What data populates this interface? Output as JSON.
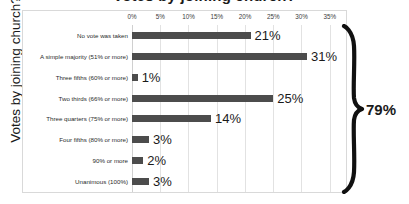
{
  "chart_data": {
    "type": "bar",
    "orientation": "horizontal",
    "title": "Votes by joining church?",
    "xlabel": "",
    "ylabel": "Votes by joining church?",
    "xlim": [
      0,
      37
    ],
    "xticks": [
      "0%",
      "5%",
      "10%",
      "15%",
      "20%",
      "25%",
      "30%",
      "35%"
    ],
    "xtick_values": [
      0,
      5,
      10,
      15,
      20,
      25,
      30,
      35
    ],
    "grid": true,
    "legend": false,
    "categories": [
      "No vote was taken",
      "A simple majority (51% or more)",
      "Three fifths (60% or more)",
      "Two thirds (66% or more)",
      "Three quarters (75% or more)",
      "Four fifths (80% or more)",
      "90% or more",
      "Unanimous (100%)"
    ],
    "values": [
      21,
      31,
      1,
      25,
      14,
      3,
      2,
      3
    ],
    "value_labels": [
      "21%",
      "31%",
      "1%",
      "25%",
      "14%",
      "3%",
      "2%",
      "3%"
    ],
    "bar_color": "#4c4c4c",
    "annotations": [
      {
        "name": "total-brace",
        "label": "79%",
        "spans_categories": [
          "A simple majority (51% or more)",
          "Three fifths (60% or more)",
          "Two thirds (66% or more)",
          "Three quarters (75% or more)",
          "Four fifths (80% or more)",
          "90% or more",
          "Unanimous (100%)"
        ]
      }
    ]
  },
  "callout": {
    "total_label": "79%"
  },
  "colors": {
    "bar": "#4c4c4c",
    "grid": "#e2e2e2",
    "frame": "#d9d9d9",
    "text": "#1a1a1a"
  }
}
